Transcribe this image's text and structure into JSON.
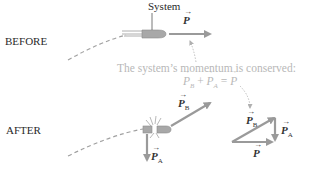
{
  "diagram": {
    "labels": {
      "system": "System",
      "before": "BEFORE",
      "after": "AFTER"
    },
    "annotation": {
      "line1": "The system’s momentum is conserved:",
      "equation": "P⃗B + P⃗A = P⃗"
    },
    "vectors": {
      "P": "P",
      "PB": "P",
      "PB_sub": "B",
      "PA": "P",
      "PA_sub": "A"
    },
    "colors": {
      "arrow": "#9a9a9a",
      "text": "#2a2a2a",
      "note": "#b8b8b8",
      "dash": "#9a9a9a",
      "projectile": "#a8a8a8"
    }
  }
}
